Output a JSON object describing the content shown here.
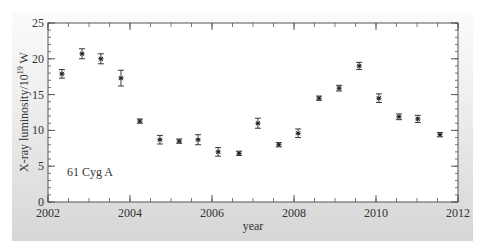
{
  "chart_data": {
    "type": "scatter",
    "title": "",
    "xlabel": "year",
    "ylabel": "X-ray luminosity/10",
    "ylabel_exponent": "19",
    "ylabel_unit": " W",
    "annotation": "61 Cyg A",
    "xlim": [
      2002,
      2012
    ],
    "ylim": [
      0,
      25
    ],
    "x_major_ticks": [
      2002,
      2004,
      2006,
      2008,
      2010,
      2012
    ],
    "x_minor_step": 0.5,
    "y_major_ticks": [
      0,
      5,
      10,
      15,
      20,
      25
    ],
    "y_minor_step": 1,
    "grid": false,
    "legend": null,
    "marker": "asterisk with error bars",
    "series": [
      {
        "name": "61 Cyg A",
        "x": [
          2002.34,
          2002.83,
          2003.29,
          2003.78,
          2004.24,
          2004.73,
          2005.2,
          2005.66,
          2006.15,
          2006.66,
          2007.12,
          2007.63,
          2008.1,
          2008.61,
          2009.1,
          2009.59,
          2010.07,
          2010.56,
          2011.02,
          2011.56
        ],
        "values": [
          17.9,
          20.7,
          20.0,
          17.3,
          11.3,
          8.7,
          8.5,
          8.7,
          7.0,
          6.8,
          11.0,
          8.0,
          9.6,
          14.5,
          15.9,
          19.0,
          14.5,
          11.9,
          11.6,
          9.4
        ],
        "errors": [
          0.6,
          0.7,
          0.7,
          1.1,
          0.3,
          0.6,
          0.3,
          0.7,
          0.6,
          0.3,
          0.7,
          0.3,
          0.6,
          0.3,
          0.4,
          0.5,
          0.6,
          0.4,
          0.5,
          0.3
        ]
      }
    ]
  },
  "colors": {
    "axis": "#555555",
    "marker": "#222222",
    "plot_bg": "#ffffff"
  }
}
